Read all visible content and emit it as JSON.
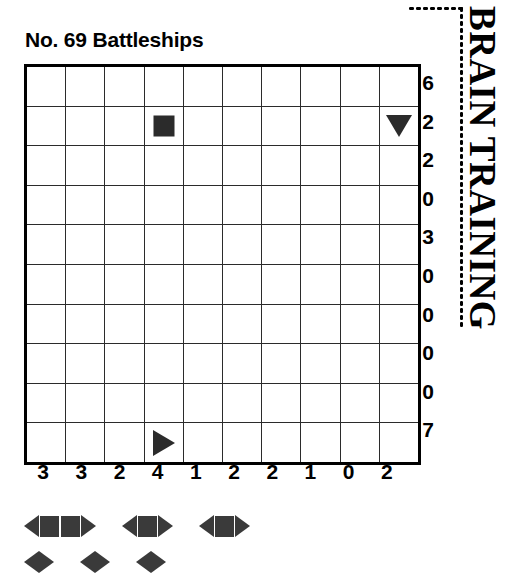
{
  "puzzle": {
    "title": "No. 69 Battleships",
    "number": "69",
    "type": "Battleships"
  },
  "brand": {
    "text": "BRAIN TRAINING"
  },
  "grid": {
    "rows": 10,
    "cols": 10,
    "row_clues": [
      6,
      2,
      2,
      0,
      3,
      0,
      0,
      0,
      0,
      7
    ],
    "col_clues": [
      3,
      3,
      2,
      4,
      1,
      2,
      2,
      1,
      0,
      2
    ],
    "given_markers": [
      {
        "row": 2,
        "col": 4,
        "shape": "square",
        "name": "ship-middle"
      },
      {
        "row": 2,
        "col": 10,
        "shape": "tri-down",
        "name": "ship-end-bottom"
      },
      {
        "row": 10,
        "col": 4,
        "shape": "tri-right",
        "name": "ship-end-right"
      }
    ]
  },
  "fleet": {
    "rows": [
      [
        {
          "name": "battleship",
          "size": 4,
          "count": 1
        },
        {
          "name": "cruiser",
          "size": 3,
          "count": 1
        },
        {
          "name": "cruiser",
          "size": 3,
          "count": 1
        }
      ],
      [
        {
          "name": "destroyer",
          "size": 2,
          "count": 1
        },
        {
          "name": "destroyer",
          "size": 2,
          "count": 1
        },
        {
          "name": "destroyer",
          "size": 2,
          "count": 1
        },
        {
          "name": "submarines",
          "size": 1,
          "count": 4
        }
      ]
    ]
  },
  "colors": {
    "ink": "#000000",
    "marker": "#2b2b2b",
    "fleet": "#3a3a3a",
    "grid_line": "#2b2b2b",
    "background": "#ffffff"
  }
}
